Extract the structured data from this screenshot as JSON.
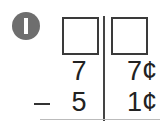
{
  "problem": {
    "number": "1",
    "answer_boxes": [
      {
        "column": "dimes",
        "value": ""
      },
      {
        "column": "cents",
        "value": ""
      }
    ],
    "minuend": {
      "tens": "7",
      "ones": "7¢"
    },
    "operator": "–",
    "subtrahend": {
      "tens": "5",
      "ones": "1¢"
    }
  },
  "colors": {
    "badge": "#6e6e6e",
    "ink": "#222222"
  }
}
